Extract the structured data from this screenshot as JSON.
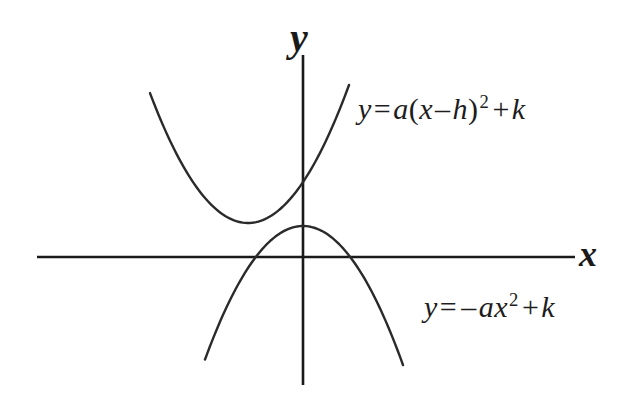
{
  "figure": {
    "background_color": "#ffffff",
    "stroke_color": "#2a2a2a",
    "axis_color": "#1a1a1a"
  },
  "axes": {
    "x_label": "x",
    "y_label": "y",
    "origin": {
      "x": 303,
      "y": 257
    },
    "x_axis": {
      "x_start": 37,
      "x_end": 575,
      "y": 257
    },
    "y_axis": {
      "y_start": 55,
      "y_end": 385,
      "x": 303
    },
    "ticks_shown": false,
    "grid_shown": false
  },
  "equations": {
    "vertex_form": {
      "lhs": "y",
      "equals": "=",
      "coefficient": "a",
      "open_paren": "(",
      "variable": "x",
      "minus": "–",
      "shift": "h",
      "close_paren": ")",
      "exponent": "2",
      "plus": "+",
      "constant": "k",
      "plain": "y = a(x – h)2 + k"
    },
    "negative_form": {
      "lhs": "y",
      "equals": "=",
      "minus": "–",
      "coefficient": "a",
      "variable": "x",
      "exponent": "2",
      "plus": "+",
      "constant": "k",
      "plain": "y = –ax2 + k"
    }
  },
  "chart_data": {
    "type": "line",
    "title": "",
    "xlabel": "x",
    "ylabel": "y",
    "grid": false,
    "legend": "annotations",
    "axis_ranges": {
      "xlim": [
        -10,
        10
      ],
      "ylim": [
        -6,
        6
      ]
    },
    "annotations": [
      {
        "text": "y = a(x – h)² + k",
        "curve": "upward-parabola",
        "position": "upper-right"
      },
      {
        "text": "y = –ax² + k",
        "curve": "downward-parabola",
        "position": "lower-right"
      }
    ],
    "series": [
      {
        "name": "y = a(x - h)^2 + k",
        "shape": "parabola-opening-up",
        "vertex_px": {
          "x": 248,
          "y": 223
        },
        "coefficient_sign": "positive",
        "y_intercept_px": {
          "x": 303,
          "y": 174
        },
        "endpoints_px": [
          {
            "x": 150,
            "y": 87
          },
          {
            "x": 349,
            "y": 85
          }
        ],
        "crosses_x_axis": false
      },
      {
        "name": "y = -a x^2 + k",
        "shape": "parabola-opening-down",
        "vertex_px": {
          "x": 303,
          "y": 226
        },
        "coefficient_sign": "negative",
        "x_intercepts_px": [
          {
            "x": 270,
            "y": 257
          },
          {
            "x": 343,
            "y": 257
          }
        ],
        "endpoints_px": [
          {
            "x": 205,
            "y": 365
          },
          {
            "x": 403,
            "y": 365
          }
        ],
        "crosses_x_axis": true
      }
    ]
  }
}
